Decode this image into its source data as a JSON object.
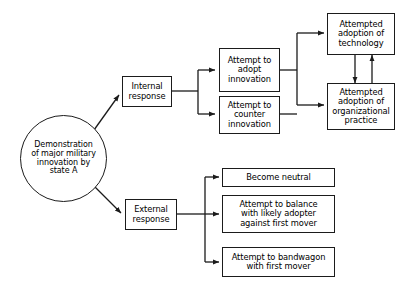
{
  "diagram": {
    "type": "flowchart",
    "stroke_color": "#1b1b1b",
    "background_color": "#ffffff",
    "nodes": [
      {
        "id": "source",
        "label": "Demonstration\nof major military\ninnovation by\nstate A",
        "shape": "circle"
      },
      {
        "id": "internal-response",
        "label": "Internal\nresponse",
        "shape": "rect"
      },
      {
        "id": "external-response",
        "label": "External\nresponse",
        "shape": "rect"
      },
      {
        "id": "adopt-innovation",
        "label": "Attempt to\nadopt\ninnovation",
        "shape": "rect"
      },
      {
        "id": "counter-innovation",
        "label": "Attempt to\ncounter\ninnovation",
        "shape": "rect"
      },
      {
        "id": "adoption-technology",
        "label": "Attempted\nadoption of\ntechnology",
        "shape": "rect"
      },
      {
        "id": "adoption-organizational-practice",
        "label": "Attempted\nadoption of\norganizational\npractice",
        "shape": "rect"
      },
      {
        "id": "become-neutral",
        "label": "Become neutral",
        "shape": "rect"
      },
      {
        "id": "balance-against-first-mover",
        "label": "Attempt to balance\nwith likely adopter\nagainst first mover",
        "shape": "rect"
      },
      {
        "id": "bandwagon-with-first-mover",
        "label": "Attempt to bandwagon\nwith first mover",
        "shape": "rect"
      }
    ],
    "edges": [
      {
        "from": "source",
        "to": "internal-response",
        "style": "diagonal-arrow"
      },
      {
        "from": "source",
        "to": "external-response",
        "style": "diagonal-arrow"
      },
      {
        "from": "internal-response",
        "to": "adopt-innovation",
        "style": "orthogonal-arrow"
      },
      {
        "from": "internal-response",
        "to": "counter-innovation",
        "style": "orthogonal-arrow"
      },
      {
        "from": "adopt-innovation",
        "to": "adoption-technology",
        "style": "orthogonal-arrow"
      },
      {
        "from": "adopt-innovation",
        "to": "adoption-organizational-practice",
        "style": "orthogonal-arrow"
      },
      {
        "from": "counter-innovation",
        "to": "adoption-technology",
        "style": "orthogonal-arrow"
      },
      {
        "from": "counter-innovation",
        "to": "adoption-organizational-practice",
        "style": "orthogonal-arrow"
      },
      {
        "from": "adoption-technology",
        "to": "adoption-organizational-practice",
        "style": "vertical-arrow-down"
      },
      {
        "from": "adoption-organizational-practice",
        "to": "adoption-technology",
        "style": "vertical-arrow-up"
      },
      {
        "from": "external-response",
        "to": "become-neutral",
        "style": "orthogonal-arrow"
      },
      {
        "from": "external-response",
        "to": "balance-against-first-mover",
        "style": "orthogonal-arrow"
      },
      {
        "from": "external-response",
        "to": "bandwagon-with-first-mover",
        "style": "orthogonal-arrow"
      }
    ]
  }
}
